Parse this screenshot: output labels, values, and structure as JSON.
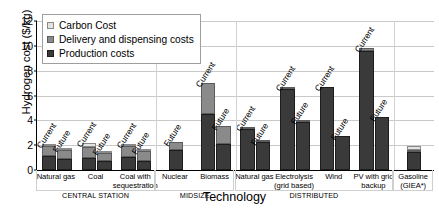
{
  "chart_data": {
    "type": "bar",
    "subtype": "stacked-grouped",
    "title": "",
    "xlabel": "Technology",
    "ylabel": "Hydrogen cost ($/kg)",
    "ylim": [
      0,
      12
    ],
    "yticks": [
      0,
      2,
      4,
      6,
      8,
      10,
      12
    ],
    "grid": true,
    "legend_position": "upper-left-inside",
    "legend": [
      "Carbon Cost",
      "Delivery and dispensing costs",
      "Production costs"
    ],
    "series": [
      {
        "name": "Production costs",
        "color": "#3a3a3a"
      },
      {
        "name": "Delivery and dispensing costs",
        "color": "#8a8a8a"
      },
      {
        "name": "Carbon Cost",
        "color": "#e2e2e2"
      }
    ],
    "groups": [
      {
        "group": "CENTRAL STATION",
        "categories": [
          {
            "label": "Natural gas",
            "bars": [
              {
                "scenario": "Current",
                "production": 1.1,
                "delivery": 0.85,
                "carbon": 0.15,
                "total": 2.1
              },
              {
                "scenario": "Future",
                "production": 0.85,
                "delivery": 0.75,
                "carbon": 0.15,
                "total": 1.75
              }
            ]
          },
          {
            "label": "Coal",
            "bars": [
              {
                "scenario": "Current",
                "production": 1.0,
                "delivery": 0.85,
                "carbon": 0.3,
                "total": 2.15
              },
              {
                "scenario": "Future",
                "production": 0.7,
                "delivery": 0.65,
                "carbon": 0.15,
                "total": 1.5
              }
            ]
          },
          {
            "label": "Coal with sequestration",
            "bars": [
              {
                "scenario": "Current",
                "production": 1.05,
                "delivery": 0.9,
                "carbon": 0.15,
                "total": 2.1
              },
              {
                "scenario": "Future",
                "production": 0.75,
                "delivery": 0.75,
                "carbon": 0.1,
                "total": 1.6
              }
            ]
          }
        ]
      },
      {
        "group": "MIDSIZE",
        "categories": [
          {
            "label": "Nuclear",
            "bars": [
              {
                "scenario": "Future",
                "production": 1.6,
                "delivery": 0.65,
                "carbon": 0.0,
                "total": 2.25
              }
            ]
          },
          {
            "label": "Biomass",
            "bars": [
              {
                "scenario": "Current",
                "production": 4.55,
                "delivery": 2.45,
                "carbon": 0.0,
                "total": 7.0
              },
              {
                "scenario": "Future",
                "production": 2.1,
                "delivery": 1.45,
                "carbon": 0.0,
                "total": 3.55
              }
            ]
          }
        ]
      },
      {
        "group": "DISTRIBUTED",
        "categories": [
          {
            "label": "Natural gas",
            "bars": [
              {
                "scenario": "Current",
                "production": 3.3,
                "delivery": 0.2,
                "carbon": 0.0,
                "total": 3.5
              },
              {
                "scenario": "Future",
                "production": 2.25,
                "delivery": 0.1,
                "carbon": 0.0,
                "total": 2.35
              }
            ]
          },
          {
            "label": "Electrolysis (grid based)",
            "bars": [
              {
                "scenario": "Current",
                "production": 6.55,
                "delivery": 0.15,
                "carbon": 0.0,
                "total": 6.7
              },
              {
                "scenario": "Future",
                "production": 3.9,
                "delivery": 0.1,
                "carbon": 0.0,
                "total": 4.0
              }
            ]
          },
          {
            "label": "Wind",
            "bars": [
              {
                "scenario": "Current",
                "production": 6.7,
                "delivery": 0.0,
                "carbon": 0.0,
                "total": 6.7
              },
              {
                "scenario": "Future",
                "production": 2.75,
                "delivery": 0.0,
                "carbon": 0.0,
                "total": 2.75
              }
            ]
          },
          {
            "label": "PV with grid backup",
            "bars": [
              {
                "scenario": "Current",
                "production": 9.6,
                "delivery": 0.2,
                "carbon": 0.0,
                "total": 9.8
              },
              {
                "scenario": "Future",
                "production": 4.3,
                "delivery": 0.0,
                "carbon": 0.0,
                "total": 4.3
              }
            ]
          }
        ]
      },
      {
        "group": "",
        "categories": [
          {
            "label": "Gasoline (GIEA*)",
            "bars": [
              {
                "scenario": "",
                "production": 1.45,
                "delivery": 0.2,
                "carbon": 0.3,
                "total": 1.95
              }
            ]
          }
        ]
      }
    ]
  },
  "axis": {
    "y_title": "Hydrogen cost ($/kg)",
    "x_title": "Technology",
    "y_ticks": [
      "0",
      "2",
      "4",
      "6",
      "8",
      "10",
      "12"
    ]
  },
  "legend": {
    "items": [
      {
        "label": "Carbon Cost",
        "color": "#e2e2e2"
      },
      {
        "label": "Delivery and dispensing costs",
        "color": "#8a8a8a"
      },
      {
        "label": "Production costs",
        "color": "#3a3a3a"
      }
    ]
  },
  "x_labels": [
    {
      "lines": [
        "Natural gas"
      ]
    },
    {
      "lines": [
        "Coal"
      ]
    },
    {
      "lines": [
        "Coal with",
        "sequestration"
      ]
    },
    {
      "lines": [
        "Nuclear"
      ]
    },
    {
      "lines": [
        "Biomass"
      ]
    },
    {
      "lines": [
        "Natural gas"
      ]
    },
    {
      "lines": [
        "Electrolysis",
        "(grid based)"
      ]
    },
    {
      "lines": [
        "Wind"
      ]
    },
    {
      "lines": [
        "PV with grid",
        "backup"
      ]
    },
    {
      "lines": [
        "Gasoline",
        "(GIEA*)"
      ]
    }
  ],
  "group_labels": [
    "CENTRAL STATION",
    "MIDSIZE",
    "DISTRIBUTED"
  ]
}
